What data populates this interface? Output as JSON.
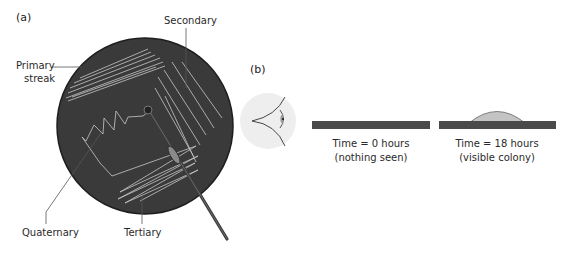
{
  "figure": {
    "panel_a": {
      "label": "(a)",
      "callouts": {
        "primary_line1": "Primary",
        "primary_line2": "streak",
        "secondary": "Secondary",
        "tertiary": "Tertiary",
        "quaternary": "Quaternary"
      }
    },
    "panel_b": {
      "label": "(b)",
      "states": [
        {
          "time": "Time = 0 hours",
          "note": "(nothing seen)"
        },
        {
          "time": "Time = 18 hours",
          "note": "(visible colony)"
        }
      ]
    },
    "colors": {
      "plate": "#3a3a3a",
      "plate_edge": "#1e1e1e",
      "streak": "#c8c8c8",
      "bar": "#4a4a4a",
      "colony": "#c4c4c4",
      "eye_halo": "#eeeeee",
      "leader_line": "#555555"
    },
    "icons": {
      "eye": "eye-icon",
      "loop": "inoculating-loop-icon"
    }
  }
}
